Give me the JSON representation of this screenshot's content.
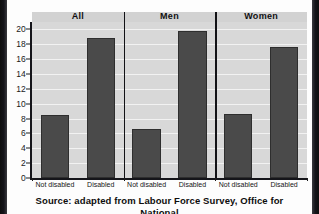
{
  "caption": "Source: adapted from Labour Force Survey, Office for National",
  "colors": {
    "bar": "#4a4a4a",
    "plot_background": "#d8d8d8",
    "gridline": "#f2f2f2",
    "axis": "#15151a",
    "separator": "#121216",
    "page_background": "#fdfdfd"
  },
  "chart_data": {
    "type": "bar",
    "title": "",
    "subtitle": "",
    "xlabel": "",
    "ylabel": "",
    "ylim": [
      0,
      21
    ],
    "yticks": [
      0,
      2,
      4,
      6,
      8,
      10,
      12,
      14,
      16,
      18,
      20
    ],
    "ytick_labels": [
      "0",
      "2",
      "4",
      "6",
      "8",
      "10",
      "12",
      "14",
      "16",
      "18",
      "20"
    ],
    "grid": true,
    "legend": false,
    "legend_position": "none",
    "panels": [
      {
        "label": "All",
        "categories": [
          "Not disabled",
          "Disabled"
        ],
        "values": [
          8.5,
          18.8
        ]
      },
      {
        "label": "Men",
        "categories": [
          "Not disabled",
          "Disabled"
        ],
        "values": [
          6.6,
          19.8
        ]
      },
      {
        "label": "Women",
        "categories": [
          "Not disabled",
          "Disabled"
        ],
        "values": [
          8.6,
          17.6
        ]
      }
    ],
    "categories": [
      "Not disabled",
      "Disabled"
    ],
    "series": [
      {
        "name": "All",
        "values": [
          8.5,
          18.8
        ]
      },
      {
        "name": "Men",
        "values": [
          6.6,
          19.8
        ]
      },
      {
        "name": "Women",
        "values": [
          8.6,
          17.6
        ]
      }
    ],
    "annotations": []
  }
}
